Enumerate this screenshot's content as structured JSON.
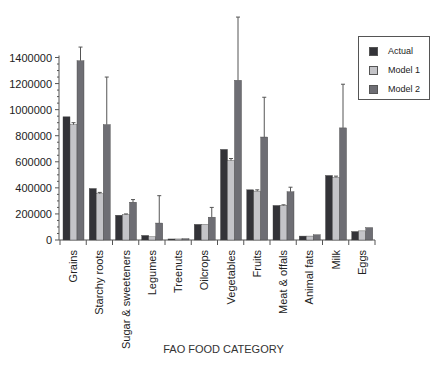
{
  "chart_data": {
    "type": "bar",
    "title": "",
    "xlabel": "FAO FOOD CATEGORY",
    "ylabel": "",
    "ylim": [
      0,
      1400000
    ],
    "yticks": [
      0,
      200000,
      400000,
      600000,
      800000,
      1000000,
      1200000,
      1400000
    ],
    "ytick_labels": [
      "0",
      "200000",
      "400000",
      "600000",
      "800000",
      "1000000",
      "1200000",
      "1400000"
    ],
    "grid": false,
    "legend_position": "upper right",
    "categories": [
      "Grains",
      "Starchy roots",
      "Sugar & sweeteners",
      "Legumes",
      "Treenuts",
      "Oilcrops",
      "Vegetables",
      "Fruits",
      "Meat & offals",
      "Animal fats",
      "Milk",
      "Eggs"
    ],
    "series": [
      {
        "name": "Actual",
        "color": "#333338",
        "values": [
          945000,
          395000,
          190000,
          35000,
          8000,
          120000,
          695000,
          385000,
          265000,
          30000,
          495000,
          65000
        ],
        "error_top": [
          null,
          null,
          null,
          null,
          null,
          null,
          null,
          null,
          null,
          null,
          null,
          null
        ]
      },
      {
        "name": "Model 1",
        "color": "#c4c4c8",
        "values": [
          885000,
          355000,
          195000,
          25000,
          8000,
          120000,
          610000,
          375000,
          265000,
          30000,
          480000,
          70000
        ],
        "error_top": [
          900000,
          365000,
          200000,
          null,
          null,
          null,
          625000,
          385000,
          270000,
          null,
          490000,
          null
        ]
      },
      {
        "name": "Model 2",
        "color": "#6e6e74",
        "values": [
          1375000,
          885000,
          290000,
          130000,
          10000,
          175000,
          1225000,
          790000,
          370000,
          40000,
          860000,
          95000
        ],
        "error_top": [
          1480000,
          1250000,
          310000,
          340000,
          null,
          250000,
          1710000,
          1095000,
          405000,
          null,
          1195000,
          null
        ]
      }
    ]
  },
  "legend": {
    "items": [
      {
        "label": "Actual",
        "color": "#333338"
      },
      {
        "label": "Model 1",
        "color": "#c4c4c8"
      },
      {
        "label": "Model 2",
        "color": "#6e6e74"
      }
    ]
  },
  "axis": {
    "xlabel": "FAO FOOD CATEGORY"
  }
}
